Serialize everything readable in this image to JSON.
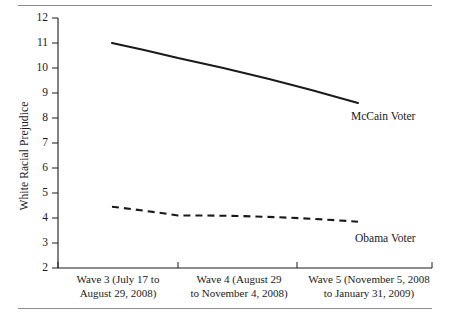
{
  "chart_data": {
    "type": "line",
    "title": "",
    "xlabel": "",
    "ylabel": "White Racial Prejudice",
    "ylim": [
      2,
      12
    ],
    "yticks": [
      2,
      3,
      4,
      5,
      6,
      7,
      8,
      9,
      10,
      11,
      12
    ],
    "ytick_labels": [
      "2",
      "3",
      "4",
      "5",
      "6",
      "7",
      "8",
      "9",
      "10",
      "11",
      "12"
    ],
    "grid": false,
    "legend_position": "inline-right",
    "categories": [
      "Wave 3 (July 17 to August 29, 2008)",
      "Wave 4 (August 29 to November 4, 2008)",
      "Wave 5 (November 5, 2008 to January 31, 2009)"
    ],
    "category_lines": [
      [
        "Wave 3 (July 17 to",
        "August 29, 2008)"
      ],
      [
        "Wave 4 (August 29",
        "to November 4, 2008)"
      ],
      [
        "Wave 5 (November 5, 2008",
        "to January 31, 2009)"
      ]
    ],
    "series": [
      {
        "name": "McCain Voter",
        "style": "solid",
        "color": "#1a1a1a",
        "values": [
          11.0,
          10.4,
          8.6
        ]
      },
      {
        "name": "Obama Voter",
        "style": "dashed",
        "color": "#1a1a1a",
        "values": [
          4.45,
          4.1,
          3.85
        ]
      }
    ]
  },
  "axis": {
    "y_label": "White Racial Prejudice",
    "tick_2": "2",
    "tick_3": "3",
    "tick_4": "4",
    "tick_5": "5",
    "tick_6": "6",
    "tick_7": "7",
    "tick_8": "8",
    "tick_9": "9",
    "tick_10": "10",
    "tick_11": "11",
    "tick_12": "12"
  },
  "xcats": {
    "wave3_line1": "Wave 3 (July 17 to",
    "wave3_line2": "August 29, 2008)",
    "wave4_line1": "Wave 4 (August 29",
    "wave4_line2": "to November 4, 2008)",
    "wave5_line1": "Wave 5 (November 5, 2008",
    "wave5_line2": "to January 31, 2009)"
  },
  "series_labels": {
    "mccain": "McCain Voter",
    "obama": "Obama Voter"
  }
}
